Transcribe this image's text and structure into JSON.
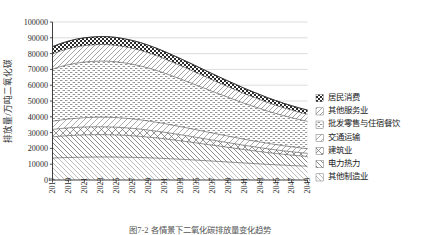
{
  "chart_data": {
    "type": "area",
    "title": "",
    "xlabel": "",
    "ylabel": "排放量/万吨二氧化碳",
    "ylim": [
      0,
      100000
    ],
    "ytick_labels": [
      "0",
      "10000",
      "20000",
      "30000",
      "40000",
      "50000",
      "60000",
      "70000",
      "80000",
      "90000",
      "100000"
    ],
    "ytick_values": [
      0,
      10000,
      20000,
      30000,
      40000,
      50000,
      60000,
      70000,
      80000,
      90000,
      100000
    ],
    "grid": true,
    "legend_position": "right",
    "stacked": true,
    "x": [
      2017,
      2018,
      2019,
      2020,
      2021,
      2022,
      2023,
      2024,
      2025,
      2026,
      2027,
      2028,
      2029,
      2030,
      2031,
      2032,
      2033,
      2034,
      2035,
      2036,
      2037,
      2038,
      2039,
      2040,
      2041,
      2042,
      2043,
      2044,
      2045,
      2046,
      2047,
      2048,
      2049
    ],
    "xtick_labels": [
      "2017",
      "2019",
      "2021",
      "2023",
      "2025",
      "2027",
      "2029",
      "2031",
      "2033",
      "2035",
      "2037",
      "2039",
      "2041",
      "2043",
      "2045",
      "2047",
      "2049"
    ],
    "series": [
      {
        "name": "其他制造业",
        "pattern": "solid-dark",
        "values": [
          13900,
          14100,
          14250,
          14350,
          14450,
          14500,
          14550,
          14550,
          14500,
          14450,
          14350,
          14200,
          14050,
          13850,
          13650,
          13400,
          13150,
          12900,
          12600,
          12300,
          12000,
          11700,
          11400,
          11100,
          10800,
          10500,
          10200,
          9900,
          9650,
          9400,
          9150,
          8950,
          8750
        ]
      },
      {
        "name": "电力热力",
        "pattern": "diagonal-forward",
        "values": [
          13400,
          13650,
          13850,
          14000,
          14100,
          14150,
          14150,
          14100,
          14000,
          13850,
          13650,
          13400,
          13100,
          12800,
          12450,
          12100,
          11700,
          11300,
          10900,
          10500,
          10100,
          9700,
          9300,
          8900,
          8500,
          8150,
          7800,
          7450,
          7150,
          6850,
          6600,
          6350,
          6150
        ]
      },
      {
        "name": "建筑业",
        "pattern": "cross-diamond",
        "values": [
          4700,
          4800,
          4900,
          4950,
          5000,
          5000,
          5000,
          4950,
          4900,
          4800,
          4700,
          4600,
          4450,
          4300,
          4150,
          4000,
          3850,
          3700,
          3550,
          3400,
          3250,
          3100,
          2950,
          2850,
          2700,
          2600,
          2500,
          2400,
          2300,
          2200,
          2150,
          2050,
          2000
        ]
      },
      {
        "name": "交通运输",
        "pattern": "diagonal-thin",
        "values": [
          5200,
          5400,
          5600,
          5750,
          5900,
          6000,
          6050,
          6100,
          6100,
          6050,
          6000,
          5900,
          5800,
          5650,
          5500,
          5300,
          5150,
          4950,
          4800,
          4600,
          4450,
          4300,
          4150,
          4000,
          3850,
          3700,
          3600,
          3450,
          3350,
          3250,
          3150,
          3050,
          2950
        ]
      },
      {
        "name": "批发零售与住宿餐饮",
        "pattern": "dotted-dash",
        "values": [
          33000,
          33800,
          34400,
          34900,
          35200,
          35400,
          35500,
          35500,
          35300,
          35000,
          34600,
          34100,
          33500,
          32800,
          32000,
          31100,
          30200,
          29300,
          28300,
          27400,
          26400,
          25500,
          24600,
          23700,
          22800,
          22000,
          21200,
          20400,
          19700,
          19000,
          18400,
          17800,
          17300
        ]
      },
      {
        "name": "其他服务业",
        "pattern": "hatch-sparse",
        "values": [
          9600,
          9900,
          10100,
          10300,
          10400,
          10450,
          10500,
          10450,
          10400,
          10250,
          10100,
          9900,
          9650,
          9400,
          9100,
          8800,
          8500,
          8200,
          7900,
          7600,
          7300,
          7000,
          6700,
          6450,
          6150,
          5900,
          5650,
          5450,
          5200,
          5000,
          4850,
          4650,
          4500
        ]
      },
      {
        "name": "居民消费",
        "pattern": "checker",
        "values": [
          4600,
          4700,
          4800,
          4900,
          4950,
          5000,
          5050,
          5050,
          5050,
          5000,
          4950,
          4900,
          4800,
          4700,
          4600,
          4500,
          4400,
          4250,
          4150,
          4000,
          3900,
          3750,
          3650,
          3500,
          3400,
          3250,
          3150,
          3050,
          2950,
          2850,
          2750,
          2700,
          2600
        ]
      }
    ],
    "totals": [
      84400,
      86350,
      87900,
      89150,
      90000,
      90500,
      90800,
      90700,
      90250,
      89400,
      88350,
      87000,
      85350,
      83500,
      81450,
      79200,
      76950,
      74600,
      72200,
      69800,
      67400,
      65050,
      62750,
      60500,
      58200,
      56100,
      54100,
      52100,
      50300,
      48550,
      47050,
      45550,
      44250
    ]
  },
  "legend": {
    "items": [
      {
        "label": "居民消费",
        "marker": "checker"
      },
      {
        "label": "其他服务业",
        "marker": "hatch-sparse"
      },
      {
        "label": "批发零售与住宿餐饮",
        "marker": "dotted-dash"
      },
      {
        "label": "交通运输",
        "marker": "diagonal-thin"
      },
      {
        "label": "建筑业",
        "marker": "cross-diamond"
      },
      {
        "label": "电力热力",
        "marker": "diagonal-forward"
      },
      {
        "label": "其他制造业",
        "marker": "solid-dark"
      }
    ]
  },
  "caption": {
    "text": "图7-2  各情景下二氧化碳排放量变化趋势"
  },
  "colors": {
    "axis": "#2b2b2b",
    "grid": "#b8b8b8",
    "series_line": "#3a3a3a",
    "pattern_fg": "#4a4a4a",
    "pattern_bg": "#ffffff"
  }
}
